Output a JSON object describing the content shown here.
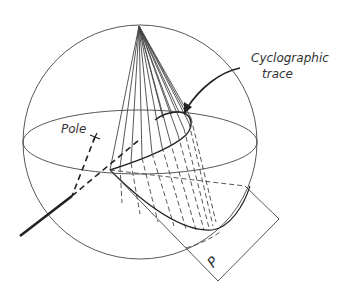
{
  "figure": {
    "type": "stereographic projection diagram",
    "labels": {
      "pole": "Pole",
      "cyclographic_trace_line1": "Cyclographic",
      "cyclographic_trace_line2": "trace",
      "plane": "P"
    }
  }
}
